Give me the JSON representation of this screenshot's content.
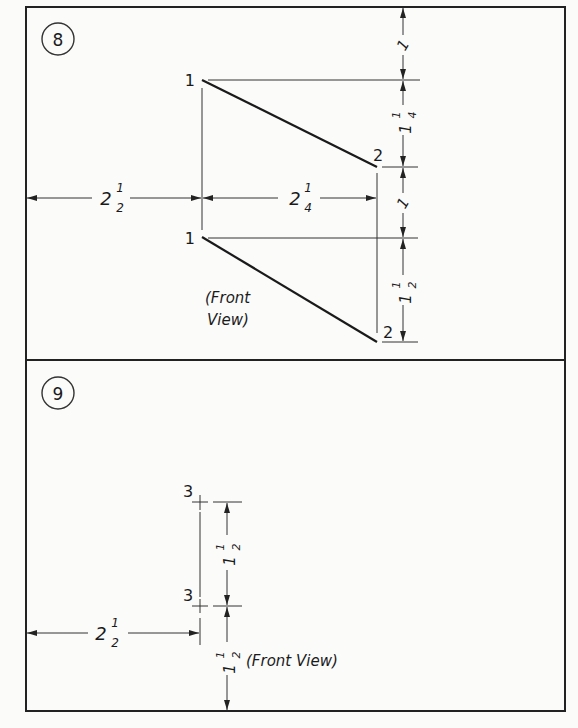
{
  "problems": [
    {
      "number": "8",
      "points": [
        {
          "label": "1",
          "view": "top",
          "x": 202,
          "y": 80
        },
        {
          "label": "2",
          "view": "top",
          "x": 377,
          "y": 167
        },
        {
          "label": "1",
          "view": "front",
          "x": 202,
          "y": 237
        },
        {
          "label": "2",
          "view": "front",
          "x": 377,
          "y": 342
        }
      ],
      "dimensions": {
        "left_offset": {
          "whole": "2",
          "num": "1",
          "den": "2"
        },
        "horizontal_span": {
          "whole": "2",
          "num": "1",
          "den": "4"
        },
        "vertical": [
          {
            "whole": "",
            "num": "1",
            "den": ""
          },
          {
            "whole": "1",
            "num": "1",
            "den": "4"
          },
          {
            "whole": "",
            "num": "1",
            "den": ""
          },
          {
            "whole": "1",
            "num": "1",
            "den": "2"
          }
        ]
      },
      "view_label_line1": "(Front",
      "view_label_line2": "View)"
    },
    {
      "number": "9",
      "points": [
        {
          "label": "3",
          "view": "top",
          "x": 200,
          "y": 502
        },
        {
          "label": "3",
          "view": "front",
          "x": 200,
          "y": 606
        }
      ],
      "dimensions": {
        "left_offset": {
          "whole": "2",
          "num": "1",
          "den": "2"
        },
        "vertical": [
          {
            "whole": "1",
            "num": "1",
            "den": "2"
          },
          {
            "whole": "1",
            "num": "1",
            "den": "2"
          }
        ]
      },
      "view_label": "(Front View)"
    }
  ],
  "colors": {
    "ink": "#1a1a1a",
    "paper": "#fbfbfa"
  }
}
